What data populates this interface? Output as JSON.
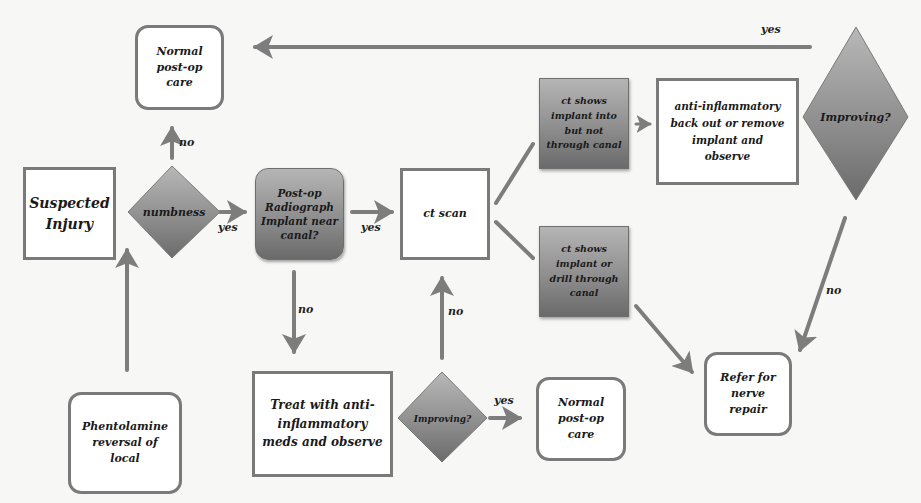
{
  "diagram": {
    "type": "flowchart",
    "colors": {
      "background": "#f7f7f6",
      "arrow": "#7d7d7d",
      "box_border": "#7a7a7a",
      "shaded_fill_top": "#b5b5b5",
      "shaded_fill_bottom": "#6a6a6a",
      "text": "#1a1a1a"
    },
    "nodes": {
      "suspected_injury": {
        "label": "Suspected\nInjury",
        "shape": "square"
      },
      "numbness": {
        "label": "numbness",
        "shape": "diamond"
      },
      "normal_care_top": {
        "label": "Normal\npost-op\ncare",
        "shape": "rounded"
      },
      "post_op_radiograph": {
        "label": "Post-op\nRadiograph\nImplant near\ncanal?",
        "shape": "shaded-rounded"
      },
      "ct_scan": {
        "label": "ct scan",
        "shape": "square"
      },
      "ct_into_not_through": {
        "label": "ct shows\nimplant into\nbut not\nthrough canal",
        "shape": "shaded-square"
      },
      "ct_through": {
        "label": "ct shows\nimplant or\ndrill through\ncanal",
        "shape": "shaded-square"
      },
      "anti_inflammatory_backout": {
        "label": "anti-inflammatory\nback out or remove\nimplant and\nobserve",
        "shape": "square"
      },
      "improving_top": {
        "label": "Improving?",
        "shape": "diamond"
      },
      "refer_nerve_repair": {
        "label": "Refer for\nnerve\nrepair",
        "shape": "rounded"
      },
      "treat_anti_inflammatory": {
        "label": "Treat with anti-\ninflammatory\nmeds and observe",
        "shape": "square"
      },
      "improving_bottom": {
        "label": "Improving?",
        "shape": "diamond"
      },
      "normal_care_bottom": {
        "label": "Normal\npost-op\ncare",
        "shape": "rounded"
      },
      "phentolamine": {
        "label": "Phentolamine\nreversal of\nlocal",
        "shape": "rounded"
      }
    },
    "edges": [
      {
        "from": "numbness",
        "to": "normal_care_top",
        "label": "no"
      },
      {
        "from": "numbness",
        "to": "post_op_radiograph",
        "label": "yes"
      },
      {
        "from": "post_op_radiograph",
        "to": "ct_scan",
        "label": "yes"
      },
      {
        "from": "post_op_radiograph",
        "to": "treat_anti_inflammatory",
        "label": "no"
      },
      {
        "from": "ct_scan",
        "to": "ct_into_not_through",
        "label": ""
      },
      {
        "from": "ct_scan",
        "to": "ct_through",
        "label": ""
      },
      {
        "from": "ct_into_not_through",
        "to": "anti_inflammatory_backout",
        "label": ""
      },
      {
        "from": "improving_top",
        "to": "normal_care_top",
        "label": "yes"
      },
      {
        "from": "improving_top",
        "to": "refer_nerve_repair",
        "label": "no"
      },
      {
        "from": "ct_through",
        "to": "refer_nerve_repair",
        "label": ""
      },
      {
        "from": "improving_bottom",
        "to": "ct_scan",
        "label": "no"
      },
      {
        "from": "improving_bottom",
        "to": "normal_care_bottom",
        "label": "yes"
      },
      {
        "from": "phentolamine",
        "to": "numbness",
        "label": ""
      }
    ],
    "edge_labels": {
      "numbness_no": "no",
      "numbness_yes": "yes",
      "radiograph_yes": "yes",
      "radiograph_no": "no",
      "improving_top_yes": "yes",
      "improving_top_no": "no",
      "improving_bottom_no": "no",
      "improving_bottom_yes": "yes"
    }
  }
}
